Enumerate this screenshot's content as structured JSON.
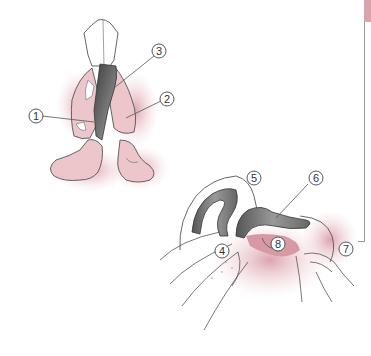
{
  "figure": {
    "top_view": {
      "callouts": [
        {
          "id": "1",
          "label": "1",
          "x": 36,
          "y": 116
        },
        {
          "id": "2",
          "label": "2",
          "x": 167,
          "y": 99
        },
        {
          "id": "3",
          "label": "3",
          "x": 159,
          "y": 51
        }
      ]
    },
    "side_view": {
      "callouts": [
        {
          "id": "5",
          "label": "5",
          "x": 254,
          "y": 178
        },
        {
          "id": "6",
          "label": "6",
          "x": 316,
          "y": 178
        },
        {
          "id": "4",
          "label": "4",
          "x": 222,
          "y": 251
        },
        {
          "id": "8",
          "label": "8",
          "x": 278,
          "y": 244
        },
        {
          "id": "7",
          "label": "7",
          "x": 346,
          "y": 249
        }
      ]
    }
  },
  "colors": {
    "skin_pink": "#e8bcc4",
    "deep_pink": "#c98491",
    "cartilage_gray": "#5a5a5a",
    "outline": "#555555",
    "margin_tab": "#d9a4ab"
  }
}
